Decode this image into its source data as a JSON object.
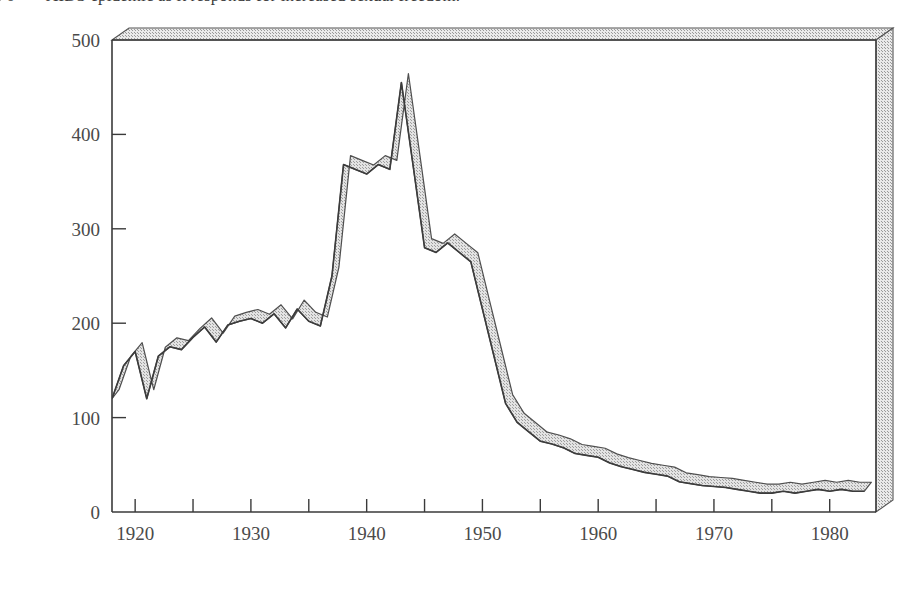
{
  "caption": {
    "number": "6",
    "text": "AIDS epidemic as it responds for increased sexual freedom."
  },
  "chart_data": {
    "type": "line",
    "title": "",
    "subtitle": "",
    "xlabel": "Year",
    "ylabel": "Cases per 100,000 population",
    "xlim": [
      1918,
      1984
    ],
    "ylim": [
      0,
      500
    ],
    "xticks": [
      1920,
      1925,
      1930,
      1935,
      1940,
      1945,
      1950,
      1955,
      1960,
      1965,
      1970,
      1975,
      1980
    ],
    "xtick_labels": [
      "1920",
      "",
      "1930",
      "",
      "1940",
      "",
      "1950",
      "",
      "1960",
      "",
      "1970",
      "",
      "1980"
    ],
    "yticks": [
      0,
      100,
      200,
      300,
      400,
      500
    ],
    "ytick_labels": [
      "0",
      "100",
      "200",
      "300",
      "400",
      "500"
    ],
    "grid": false,
    "legend_position": "inline-labels",
    "series": [
      {
        "name": "Syphilis",
        "style": "ribbon-3d",
        "color": "#4a4a4a",
        "fill": "#d9d9d9",
        "x": [
          1918,
          1919,
          1920,
          1921,
          1922,
          1923,
          1924,
          1925,
          1926,
          1927,
          1928,
          1929,
          1930,
          1931,
          1932,
          1933,
          1934,
          1935,
          1936,
          1937,
          1938,
          1939,
          1940,
          1941,
          1942,
          1943,
          1944,
          1945,
          1946,
          1947,
          1948,
          1949,
          1950,
          1951,
          1952,
          1953,
          1954,
          1955,
          1956,
          1957,
          1958,
          1959,
          1960,
          1961,
          1962,
          1963,
          1964,
          1965,
          1966,
          1967,
          1968,
          1969,
          1970,
          1971,
          1972,
          1973,
          1974,
          1975,
          1976,
          1977,
          1978,
          1979,
          1980,
          1981,
          1982,
          1983
        ],
        "y": [
          120,
          155,
          170,
          120,
          165,
          175,
          172,
          185,
          196,
          180,
          198,
          202,
          205,
          200,
          210,
          195,
          215,
          202,
          197,
          250,
          368,
          363,
          358,
          368,
          363,
          455,
          368,
          280,
          275,
          285,
          275,
          265,
          215,
          165,
          115,
          95,
          85,
          75,
          72,
          68,
          62,
          60,
          58,
          52,
          48,
          45,
          42,
          40,
          38,
          32,
          30,
          28,
          27,
          26,
          24,
          22,
          20,
          20,
          22,
          20,
          22,
          24,
          22,
          24,
          22,
          22
        ]
      },
      {
        "name": "Gonorrhea",
        "style": "dashed",
        "color": "#1a1a1a",
        "x": [
          1918,
          1919,
          1920,
          1921,
          1922,
          1923,
          1924,
          1925,
          1926,
          1927,
          1928,
          1929,
          1930,
          1931,
          1932,
          1933,
          1934,
          1935,
          1936,
          1937,
          1938,
          1939,
          1940,
          1941,
          1942,
          1943,
          1944,
          1945,
          1946,
          1947,
          1948,
          1949,
          1950,
          1951,
          1952,
          1953,
          1954,
          1955,
          1956,
          1957,
          1958,
          1959,
          1960,
          1961,
          1962,
          1963,
          1964,
          1965,
          1966,
          1967,
          1968,
          1969,
          1970,
          1971,
          1972,
          1973,
          1974,
          1975,
          1976,
          1977,
          1978,
          1979,
          1980,
          1981,
          1982,
          1983
        ],
        "y": [
          155,
          175,
          172,
          150,
          140,
          138,
          136,
          135,
          138,
          134,
          132,
          130,
          132,
          130,
          126,
          130,
          140,
          145,
          152,
          160,
          180,
          192,
          198,
          208,
          230,
          240,
          235,
          245,
          265,
          275,
          260,
          235,
          200,
          192,
          190,
          188,
          165,
          148,
          140,
          142,
          138,
          136,
          142,
          146,
          150,
          155,
          160,
          165,
          175,
          200,
          225,
          250,
          290,
          330,
          365,
          400,
          420,
          432,
          442,
          445,
          443,
          440,
          437,
          432,
          428,
          420
        ]
      }
    ],
    "annotations": [
      {
        "text": "World War II",
        "x": 1941.5,
        "y": 480,
        "type": "label"
      },
      {
        "text": "Syphilis",
        "x": 1932.5,
        "y": 360,
        "type": "series-label"
      },
      {
        "text": "Gonorrhea",
        "x": 1929.0,
        "y": 160,
        "type": "series-label"
      },
      {
        "text": "Birth control",
        "x": 1962.0,
        "y": 455,
        "type": "arrow-label-line1"
      },
      {
        "text": "pills",
        "x": 1962.0,
        "y": 425,
        "type": "arrow-label-line2"
      }
    ],
    "arrow": {
      "x": 1964.5,
      "y_from": 405,
      "y_to": 175,
      "points_to_series": "Gonorrhea"
    }
  }
}
